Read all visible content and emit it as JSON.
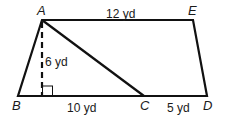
{
  "diagram": {
    "type": "trapezoid-with-triangle",
    "vertices": {
      "A": {
        "label": "A",
        "x": 42,
        "y": 20
      },
      "E": {
        "label": "E",
        "x": 193,
        "y": 20
      },
      "B": {
        "label": "B",
        "x": 18,
        "y": 96
      },
      "C": {
        "label": "C",
        "x": 144,
        "y": 96
      },
      "D": {
        "label": "D",
        "x": 207,
        "y": 96
      },
      "H": {
        "x": 42,
        "y": 96
      }
    },
    "measurements": {
      "AE": "12 yd",
      "height": "6 yd",
      "BC": "10 yd",
      "CD": "5 yd"
    },
    "colors": {
      "stroke": "#111111",
      "background": "#ffffff"
    }
  }
}
